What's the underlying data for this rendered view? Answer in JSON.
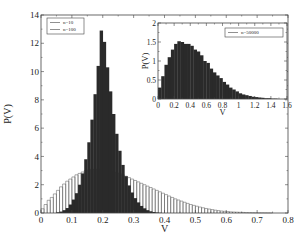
{
  "chart_data": [
    {
      "type": "bar",
      "subtype": "histogram",
      "title": "",
      "xlabel": "V",
      "ylabel": "P(V)",
      "xlim": [
        0,
        0.8
      ],
      "ylim": [
        0,
        14
      ],
      "xticks": [
        "0",
        "0.1",
        "0.2",
        "0.3",
        "0.4",
        "0.5",
        "0.6",
        "0.7",
        "0.8"
      ],
      "yticks": [
        "0",
        "2",
        "4",
        "6",
        "8",
        "10",
        "12",
        "14"
      ],
      "grid": false,
      "legend_position": "upper-left",
      "bin_width": 0.01,
      "series": [
        {
          "name": "n=10",
          "style": "outlined",
          "x": [
            0.005,
            0.015,
            0.025,
            0.035,
            0.045,
            0.055,
            0.065,
            0.075,
            0.085,
            0.095,
            0.105,
            0.115,
            0.125,
            0.135,
            0.145,
            0.155,
            0.165,
            0.175,
            0.185,
            0.195,
            0.205,
            0.215,
            0.225,
            0.235,
            0.245,
            0.255,
            0.265,
            0.275,
            0.285,
            0.295,
            0.305,
            0.315,
            0.325,
            0.335,
            0.345,
            0.355,
            0.365,
            0.375,
            0.385,
            0.395,
            0.405,
            0.415,
            0.425,
            0.435,
            0.445,
            0.455,
            0.465,
            0.475,
            0.485,
            0.495,
            0.505,
            0.515,
            0.525,
            0.535,
            0.545,
            0.555,
            0.565,
            0.575,
            0.585,
            0.595,
            0.605,
            0.615,
            0.625,
            0.635,
            0.645,
            0.655,
            0.665,
            0.675,
            0.685,
            0.695,
            0.705,
            0.715,
            0.725,
            0.735,
            0.745
          ],
          "values": [
            0.3,
            0.6,
            0.9,
            1.1,
            1.35,
            1.6,
            1.85,
            2.05,
            2.25,
            2.4,
            2.55,
            2.7,
            2.8,
            2.9,
            3.0,
            3.05,
            3.1,
            3.1,
            3.1,
            3.1,
            3.05,
            3.0,
            2.95,
            2.9,
            2.85,
            2.8,
            2.7,
            2.6,
            2.5,
            2.4,
            2.3,
            2.2,
            2.1,
            2.0,
            1.9,
            1.8,
            1.7,
            1.6,
            1.5,
            1.4,
            1.3,
            1.2,
            1.1,
            1.0,
            0.92,
            0.84,
            0.76,
            0.68,
            0.6,
            0.54,
            0.48,
            0.42,
            0.37,
            0.32,
            0.28,
            0.24,
            0.2,
            0.17,
            0.14,
            0.12,
            0.1,
            0.08,
            0.07,
            0.06,
            0.05,
            0.04,
            0.03,
            0.025,
            0.02,
            0.015,
            0.01,
            0.01,
            0.008,
            0.006,
            0.005
          ]
        },
        {
          "name": "n=100",
          "style": "filled",
          "color": "#2a2a2a",
          "x": [
            0.055,
            0.065,
            0.075,
            0.085,
            0.095,
            0.105,
            0.115,
            0.125,
            0.135,
            0.145,
            0.155,
            0.165,
            0.175,
            0.185,
            0.195,
            0.205,
            0.215,
            0.225,
            0.235,
            0.245,
            0.255,
            0.265,
            0.275,
            0.285,
            0.295,
            0.305,
            0.315,
            0.325,
            0.335,
            0.345,
            0.355,
            0.365,
            0.375,
            0.385
          ],
          "values": [
            0.05,
            0.1,
            0.2,
            0.35,
            0.6,
            0.95,
            1.4,
            2.0,
            2.8,
            3.8,
            5.0,
            6.6,
            8.4,
            10.4,
            12.9,
            12.1,
            10.3,
            8.6,
            7.0,
            5.6,
            4.4,
            3.4,
            2.6,
            1.95,
            1.45,
            1.05,
            0.75,
            0.5,
            0.33,
            0.2,
            0.12,
            0.07,
            0.04,
            0.02
          ]
        }
      ]
    },
    {
      "type": "bar",
      "subtype": "histogram",
      "role": "inset",
      "title": "",
      "xlabel": "V",
      "ylabel": "P(V)",
      "xlim": [
        0,
        1.6
      ],
      "ylim": [
        0,
        2
      ],
      "xticks": [
        "0",
        "0.2",
        "0.4",
        "0.6",
        "0.8",
        "1",
        "1.2",
        "1.4",
        "1.6"
      ],
      "yticks": [
        "0",
        "0.5",
        "1",
        "1.5",
        "2"
      ],
      "grid": false,
      "legend_position": "upper-right",
      "bin_width": 0.04,
      "series": [
        {
          "name": "n=50000",
          "style": "filled",
          "color": "#2a2a2a",
          "x": [
            0.02,
            0.06,
            0.1,
            0.14,
            0.18,
            0.22,
            0.26,
            0.3,
            0.34,
            0.38,
            0.42,
            0.46,
            0.5,
            0.54,
            0.58,
            0.62,
            0.66,
            0.7,
            0.74,
            0.78,
            0.82,
            0.86,
            0.9,
            0.94,
            0.98,
            1.02,
            1.06,
            1.1,
            1.14,
            1.18,
            1.22,
            1.26,
            1.3,
            1.34,
            1.38,
            1.42,
            1.46
          ],
          "values": [
            0.3,
            0.6,
            0.9,
            1.1,
            1.3,
            1.45,
            1.52,
            1.5,
            1.45,
            1.45,
            1.4,
            1.3,
            1.25,
            1.15,
            1.0,
            0.95,
            0.8,
            0.7,
            0.62,
            0.55,
            0.45,
            0.38,
            0.3,
            0.25,
            0.2,
            0.15,
            0.12,
            0.1,
            0.08,
            0.06,
            0.05,
            0.04,
            0.03,
            0.02,
            0.02,
            0.01,
            0.01
          ]
        }
      ]
    }
  ]
}
